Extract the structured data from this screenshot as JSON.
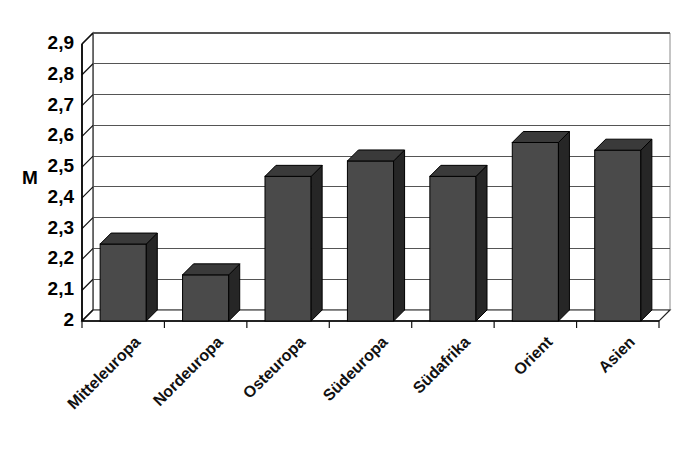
{
  "chart_data": {
    "type": "bar",
    "title": "",
    "subtitle": "",
    "xlabel": "",
    "ylabel": "M",
    "categories": [
      "Mitteleuropa",
      "Nordeuropa",
      "Osteuropa",
      "Südeuropa",
      "Südafrika",
      "Orient",
      "Asien"
    ],
    "values": [
      2.25,
      2.15,
      2.47,
      2.52,
      2.47,
      2.58,
      2.555
    ],
    "series": [
      {
        "name": "M",
        "values": [
          2.25,
          2.15,
          2.47,
          2.52,
          2.47,
          2.58,
          2.555
        ]
      }
    ],
    "ylim": [
      2.0,
      2.9
    ],
    "ytick_labels": [
      "2",
      "2,1",
      "2,2",
      "2,3",
      "2,4",
      "2,5",
      "2,6",
      "2,7",
      "2,8",
      "2,9"
    ],
    "ytick_values": [
      2.0,
      2.1,
      2.2,
      2.3,
      2.4,
      2.5,
      2.6,
      2.7,
      2.8,
      2.9
    ],
    "grid": true,
    "grid_axis": "y",
    "legend": false,
    "legend_position": "none",
    "style": "3d-column",
    "bar_color": "#4a4a4a",
    "bar_side_color": "#262626",
    "bar_top_color": "#3a3a3a",
    "bar_edge_color": "#000000",
    "grid_color": "#555555",
    "axis_color": "#000000",
    "wall_color": "#ffffff",
    "floor_color": "#ffffff",
    "background": "#ffffff",
    "category_label_rotation": -45,
    "annotations": []
  }
}
